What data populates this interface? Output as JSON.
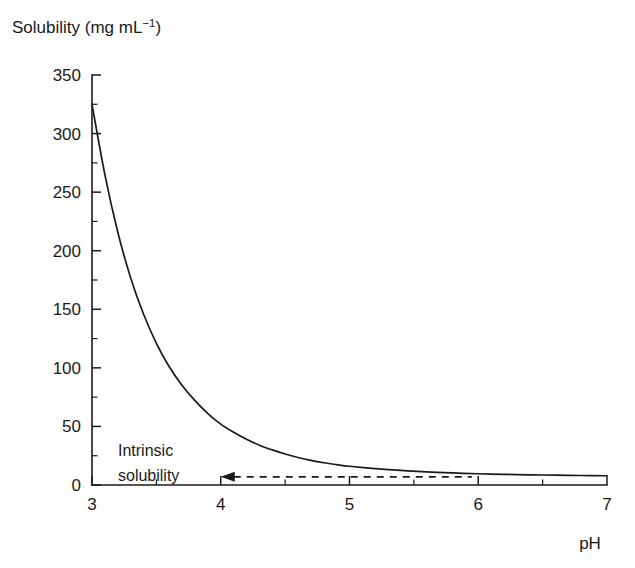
{
  "chart_data": {
    "type": "line",
    "title": "",
    "ylabel": "Solubility (mg mL−1)",
    "ylabel_base": "Solubility (mg mL",
    "ylabel_sup": "−1",
    "ylabel_close": ")",
    "xlabel": "pH",
    "xlim": [
      3,
      7
    ],
    "ylim": [
      0,
      350
    ],
    "grid": false,
    "legend": "none",
    "x_ticks": [
      3,
      4,
      5,
      6,
      7
    ],
    "x_tick_labels": [
      "3",
      "4",
      "5",
      "6",
      "7"
    ],
    "x_minor_ticks": [
      3.5,
      4.5,
      5.5,
      6.5
    ],
    "y_ticks": [
      0,
      50,
      100,
      150,
      200,
      250,
      300,
      350
    ],
    "y_tick_labels": [
      "0",
      "50",
      "100",
      "150",
      "200",
      "250",
      "300",
      "350"
    ],
    "y_minor_ticks": [
      25,
      75,
      125,
      175,
      225,
      275,
      325
    ],
    "series": [
      {
        "name": "pH-solubility profile",
        "x": [
          3.0,
          3.1,
          3.2,
          3.3,
          3.4,
          3.5,
          3.6,
          3.7,
          3.8,
          3.9,
          4.0,
          4.1,
          4.2,
          4.3,
          4.4,
          4.5,
          4.6,
          4.7,
          4.8,
          4.9,
          5.0,
          5.2,
          5.4,
          5.6,
          5.8,
          6.0,
          6.2,
          6.4,
          6.6,
          6.8,
          7.0
        ],
        "y": [
          325,
          265,
          216,
          177,
          146,
          121,
          101,
          85,
          72,
          61,
          52,
          45,
          39,
          34,
          30,
          26.5,
          23.5,
          21,
          19,
          17.4,
          16,
          14,
          12.4,
          11.2,
          10.3,
          9.6,
          9.1,
          8.7,
          8.4,
          8.1,
          7.9
        ]
      }
    ],
    "annotations": [
      {
        "name": "intrinsic-solubility",
        "line1": "Intrinsic",
        "line2": "solubility",
        "arrow_tip_x": 4.0,
        "arrow_y": 7,
        "dash_end_x": 5.95
      }
    ],
    "colors": {
      "curve": "#1a1a1a",
      "axis": "#1a1a1a",
      "text": "#1a1a1a",
      "background": "#ffffff"
    }
  }
}
